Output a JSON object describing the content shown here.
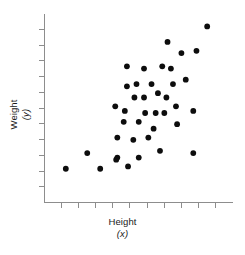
{
  "chart_data": {
    "type": "scatter",
    "title": "",
    "xlabel": "Height",
    "xlabel_sub": "(x)",
    "ylabel": "Weight",
    "ylabel_sub": "(y)",
    "grid": false,
    "legend": "none",
    "xlim": [
      0,
      100
    ],
    "ylim": [
      0,
      100
    ],
    "x_tick_count": 10,
    "y_tick_count": 11,
    "x_tick_labels": [],
    "y_tick_labels": [],
    "point_color": "#0d0d0d",
    "axis_color": "#8d8d8d",
    "n_points": 40,
    "points": [
      {
        "x": 11.6,
        "y": 17.6
      },
      {
        "x": 23.0,
        "y": 25.9
      },
      {
        "x": 29.9,
        "y": 17.6
      },
      {
        "x": 39.0,
        "y": 23.5
      },
      {
        "x": 38.4,
        "y": 22.4
      },
      {
        "x": 44.7,
        "y": 18.8
      },
      {
        "x": 50.4,
        "y": 23.5
      },
      {
        "x": 39.0,
        "y": 34.1
      },
      {
        "x": 42.4,
        "y": 42.4
      },
      {
        "x": 37.9,
        "y": 50.6
      },
      {
        "x": 43.0,
        "y": 48.2
      },
      {
        "x": 48.1,
        "y": 55.3
      },
      {
        "x": 53.2,
        "y": 55.3
      },
      {
        "x": 53.8,
        "y": 47.1
      },
      {
        "x": 59.4,
        "y": 47.1
      },
      {
        "x": 58.3,
        "y": 38.8
      },
      {
        "x": 64.0,
        "y": 47.1
      },
      {
        "x": 65.1,
        "y": 55.3
      },
      {
        "x": 70.2,
        "y": 50.6
      },
      {
        "x": 70.8,
        "y": 41.2
      },
      {
        "x": 49.2,
        "y": 62.4
      },
      {
        "x": 57.2,
        "y": 62.4
      },
      {
        "x": 44.1,
        "y": 61.2
      },
      {
        "x": 53.2,
        "y": 70.6
      },
      {
        "x": 62.9,
        "y": 71.8
      },
      {
        "x": 67.5,
        "y": 70.6
      },
      {
        "x": 68.6,
        "y": 62.4
      },
      {
        "x": 75.4,
        "y": 64.7
      },
      {
        "x": 73.1,
        "y": 78.8
      },
      {
        "x": 65.7,
        "y": 84.7
      },
      {
        "x": 81.1,
        "y": 80.0
      },
      {
        "x": 86.8,
        "y": 92.9
      },
      {
        "x": 79.4,
        "y": 48.2
      },
      {
        "x": 79.4,
        "y": 25.9
      },
      {
        "x": 61.7,
        "y": 27.1
      },
      {
        "x": 47.5,
        "y": 32.9
      },
      {
        "x": 44.1,
        "y": 71.8
      },
      {
        "x": 60.6,
        "y": 57.6
      },
      {
        "x": 55.5,
        "y": 34.1
      },
      {
        "x": 50.4,
        "y": 42.4
      }
    ]
  },
  "figure": {
    "background": "#ffffff",
    "plot_left": 44,
    "plot_right": 232,
    "plot_top": 13,
    "plot_bottom": 202
  }
}
